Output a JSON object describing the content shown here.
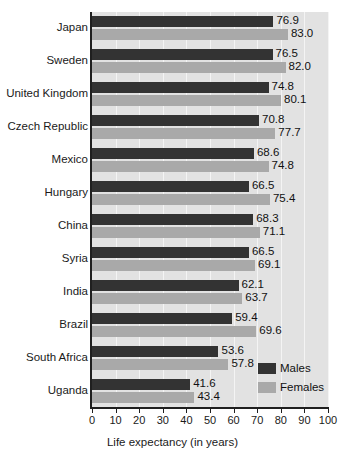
{
  "chart_data": {
    "type": "bar",
    "orientation": "horizontal",
    "title": "",
    "xlabel": "Life expectancy (in years)",
    "ylabel": "",
    "xlim": [
      0,
      100
    ],
    "xticks": [
      0,
      10,
      20,
      30,
      40,
      50,
      60,
      70,
      80,
      90,
      100
    ],
    "grid": true,
    "grid_axis": "x",
    "legend_position": "bottom-right",
    "categories": [
      "Japan",
      "Sweden",
      "United Kingdom",
      "Czech Republic",
      "Mexico",
      "Hungary",
      "China",
      "Syria",
      "India",
      "Brazil",
      "South Africa",
      "Uganda"
    ],
    "series": [
      {
        "name": "Males",
        "color": "#333333",
        "values": [
          76.9,
          76.5,
          74.8,
          70.8,
          68.6,
          66.5,
          68.3,
          66.5,
          62.1,
          59.4,
          53.6,
          41.6
        ]
      },
      {
        "name": "Females",
        "color": "#a9a9a9",
        "values": [
          83.0,
          82.0,
          80.1,
          77.7,
          74.8,
          75.4,
          71.1,
          69.1,
          63.7,
          69.6,
          57.8,
          43.4
        ]
      }
    ],
    "data_labels": {
      "Males": [
        "76.9",
        "76.5",
        "74.8",
        "70.8",
        "68.6",
        "66.5",
        "68.3",
        "66.5",
        "62.1",
        "59.4",
        "53.6",
        "41.6"
      ],
      "Females": [
        "83.0",
        "82.0",
        "80.1",
        "77.7",
        "74.8",
        "75.4",
        "71.1",
        "69.1",
        "63.7",
        "69.6",
        "57.8",
        "43.4"
      ]
    }
  },
  "legend": {
    "items": [
      {
        "label": "Males",
        "color": "#333333"
      },
      {
        "label": "Females",
        "color": "#a9a9a9"
      }
    ]
  },
  "axis": {
    "x_title": "Life expectancy (in years)",
    "tick_labels": [
      "0",
      "10",
      "20",
      "30",
      "40",
      "50",
      "60",
      "70",
      "80",
      "90",
      "100"
    ]
  },
  "colors": {
    "males_bar": "#333333",
    "females_bar": "#a9a9a9",
    "plot_background": "#e2e2e2",
    "gridline": "#f4f4f4",
    "axis_line": "#1f1f1f",
    "text": "#1a1a1a",
    "page_background": "#ffffff"
  }
}
